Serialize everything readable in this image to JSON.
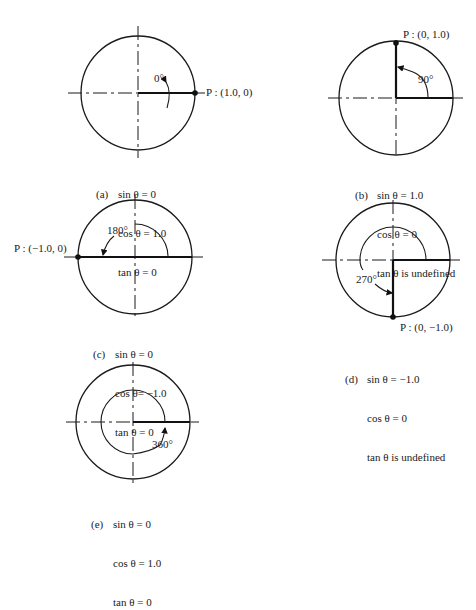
{
  "figure": {
    "panels": [
      {
        "id": "a",
        "tag": "(a)",
        "angle_label": "0°",
        "point_label": "P : (1.0, 0)",
        "lines": [
          "sin θ = 0",
          "cos θ = 1.0",
          "tan θ = 0"
        ]
      },
      {
        "id": "b",
        "tag": "(b)",
        "angle_label": "90°",
        "point_label": "P : (0, 1.0)",
        "lines": [
          "sin θ = 1.0",
          "cos θ = 0",
          "tan θ is undefined"
        ]
      },
      {
        "id": "c",
        "tag": "(c)",
        "angle_label": "180°",
        "point_label": "P : (−1.0, 0)",
        "lines": [
          "sin θ = 0",
          "cos θ= −1.0",
          "tan θ = 0"
        ]
      },
      {
        "id": "d",
        "tag": "(d)",
        "angle_label": "270°",
        "point_label": "P : (0, −1.0)",
        "lines": [
          "sin θ = −1.0",
          "cos θ = 0",
          "tan θ is undefined"
        ]
      },
      {
        "id": "e",
        "tag": "(e)",
        "angle_label": "360°",
        "point_label": "",
        "lines": [
          "sin θ = 0",
          "cos θ = 1.0",
          "tan θ = 0"
        ]
      }
    ],
    "colors": {
      "ink": "#1a1a1a",
      "background": "#ffffff"
    }
  }
}
